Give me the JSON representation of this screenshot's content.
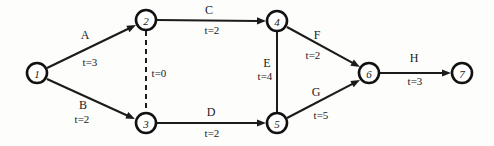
{
  "diagram": {
    "type": "activity-on-arrow-network",
    "width": 494,
    "height": 146,
    "background_color": "#fdfdfc",
    "ink_color": "#1b1b1b",
    "nodes": [
      {
        "id": "1",
        "label": "1",
        "x": 37,
        "y": 73,
        "r": 10
      },
      {
        "id": "2",
        "label": "2",
        "x": 146,
        "y": 20,
        "r": 10
      },
      {
        "id": "3",
        "label": "3",
        "x": 146,
        "y": 123,
        "r": 10
      },
      {
        "id": "4",
        "label": "4",
        "x": 277,
        "y": 21,
        "r": 10
      },
      {
        "id": "5",
        "label": "5",
        "x": 277,
        "y": 123,
        "r": 10
      },
      {
        "id": "6",
        "label": "6",
        "x": 369,
        "y": 73,
        "r": 10
      },
      {
        "id": "7",
        "label": "7",
        "x": 462,
        "y": 73,
        "r": 10
      }
    ],
    "edges": [
      {
        "id": "A",
        "label": "A",
        "duration": "t=3",
        "from": "1",
        "to": "2",
        "style": "solid",
        "arrow": true,
        "x1": 47,
        "y1": 68,
        "x2": 136,
        "y2": 25,
        "label_x": 85,
        "label_y": 35,
        "duration_x": 90,
        "duration_y": 62
      },
      {
        "id": "B",
        "label": "B",
        "duration": "t=2",
        "from": "1",
        "to": "3",
        "style": "solid",
        "arrow": true,
        "x1": 47,
        "y1": 79,
        "x2": 135,
        "y2": 119,
        "label_x": 83,
        "label_y": 105,
        "duration_x": 82,
        "duration_y": 119
      },
      {
        "id": "C",
        "label": "C",
        "duration": "t=2",
        "from": "2",
        "to": "4",
        "style": "solid",
        "arrow": true,
        "x1": 157,
        "y1": 20,
        "x2": 266,
        "y2": 21,
        "label_x": 209,
        "label_y": 10,
        "duration_x": 212,
        "duration_y": 30
      },
      {
        "id": "dummy",
        "label": "",
        "duration": "t=0",
        "from": "2",
        "to": "3",
        "style": "dashed",
        "arrow": false,
        "x1": 146,
        "y1": 31,
        "x2": 146,
        "y2": 112,
        "label_x": 146,
        "label_y": 71,
        "duration_x": 159,
        "duration_y": 73
      },
      {
        "id": "D",
        "label": "D",
        "duration": "t=2",
        "from": "3",
        "to": "5",
        "style": "solid",
        "arrow": true,
        "x1": 157,
        "y1": 123,
        "x2": 266,
        "y2": 123,
        "label_x": 211,
        "label_y": 112,
        "duration_x": 212,
        "duration_y": 133
      },
      {
        "id": "E",
        "label": "E",
        "duration": "t=4",
        "from": "4",
        "to": "5",
        "style": "solid",
        "arrow": false,
        "x1": 277,
        "y1": 32,
        "x2": 277,
        "y2": 113,
        "label_x": 267,
        "label_y": 63,
        "duration_x": 265,
        "duration_y": 76
      },
      {
        "id": "F",
        "label": "F",
        "duration": "t=2",
        "from": "4",
        "to": "6",
        "style": "solid",
        "arrow": true,
        "x1": 287,
        "y1": 27,
        "x2": 360,
        "y2": 67,
        "label_x": 317,
        "label_y": 35,
        "duration_x": 313,
        "duration_y": 55
      },
      {
        "id": "G",
        "label": "G",
        "duration": "t=5",
        "from": "5",
        "to": "6",
        "style": "solid",
        "arrow": true,
        "x1": 287,
        "y1": 118,
        "x2": 360,
        "y2": 80,
        "label_x": 316,
        "label_y": 92,
        "duration_x": 321,
        "duration_y": 115
      },
      {
        "id": "H",
        "label": "H",
        "duration": "t=3",
        "from": "6",
        "to": "7",
        "style": "solid",
        "arrow": true,
        "x1": 380,
        "y1": 73,
        "x2": 451,
        "y2": 73,
        "label_x": 414,
        "label_y": 58,
        "duration_x": 415,
        "duration_y": 81
      }
    ]
  }
}
